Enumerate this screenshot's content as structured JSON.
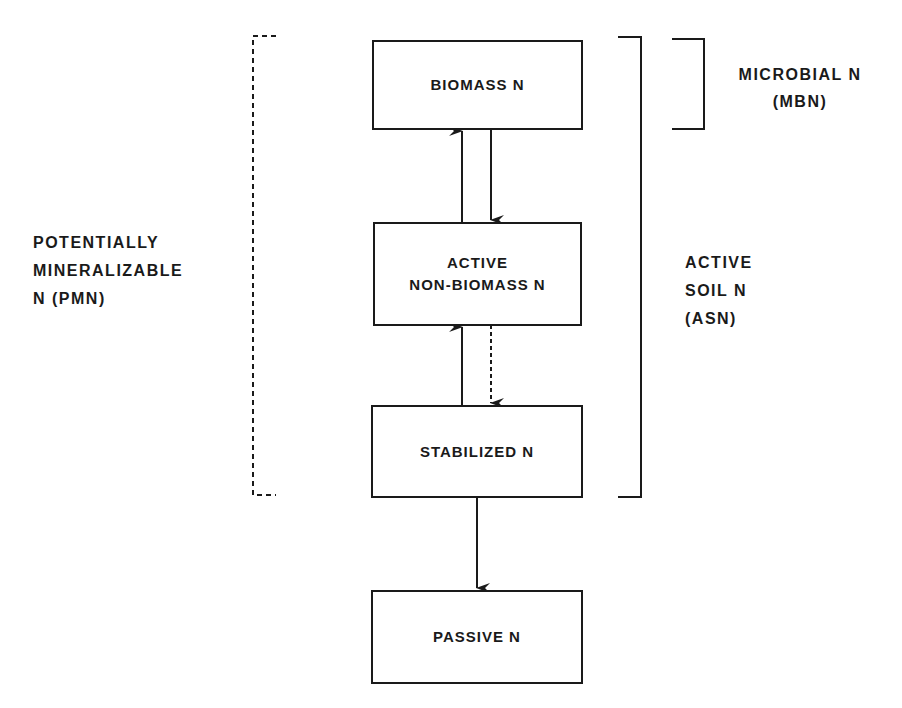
{
  "diagram": {
    "boxes": {
      "biomass": "BIOMASS  N",
      "active_non_biomass": "ACTIVE\nNON-BIOMASS  N",
      "stabilized": "STABILIZED  N",
      "passive": "PASSIVE  N"
    },
    "brackets": {
      "pmn": "POTENTIALLY\nMINERALIZABLE\nN (PMN)",
      "asn": "ACTIVE\nSOIL N\n (ASN)",
      "mbn": "MICROBIAL  N\n(MBN)"
    },
    "flows": [
      {
        "from": "active_non_biomass",
        "to": "biomass",
        "style": "solid"
      },
      {
        "from": "biomass",
        "to": "active_non_biomass",
        "style": "solid"
      },
      {
        "from": "stabilized",
        "to": "active_non_biomass",
        "style": "solid"
      },
      {
        "from": "active_non_biomass",
        "to": "stabilized",
        "style": "dashed"
      },
      {
        "from": "stabilized",
        "to": "passive",
        "style": "solid"
      }
    ],
    "colors": {
      "ink": "#1a1a1a",
      "background": "#ffffff"
    }
  }
}
